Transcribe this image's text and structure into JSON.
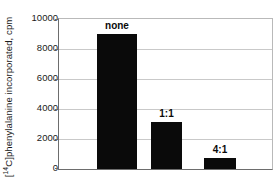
{
  "chart_data": {
    "type": "bar",
    "title": "",
    "subtitle": "",
    "xlabel": "",
    "ylabel": "[14C]phenylalanine incorporated, cpm",
    "ylabel_parts": {
      "open_bracket": "[",
      "superscript": "14",
      "rest": "C]phenylalanine incorporated, cpm"
    },
    "categories": [
      "none",
      "1:1",
      "4:1"
    ],
    "values": [
      9000,
      3100,
      700
    ],
    "data_labels": [
      "none",
      "1:1",
      "4:1"
    ],
    "ylim": [
      0,
      10000
    ],
    "yticks": [
      0,
      2000,
      4000,
      6000,
      8000,
      10000
    ],
    "ytick_labels": [
      "0",
      "2000",
      "4000",
      "6000",
      "8000",
      "10000"
    ],
    "xtick_labels": [
      "",
      "",
      ""
    ],
    "grid": "horizontal",
    "legend": "none",
    "bar_color": "#0a0a0a",
    "grid_color": "#c9c9c9",
    "axis_color": "#6d6d6d",
    "background": "#ffffff",
    "bars_geometry": [
      {
        "label": "none",
        "left_px": 38,
        "width_px": 40,
        "value": 9000
      },
      {
        "label": "1:1",
        "left_px": 92,
        "width_px": 31,
        "value": 3100
      },
      {
        "label": "4:1",
        "left_px": 145,
        "width_px": 32,
        "value": 700
      }
    ]
  }
}
